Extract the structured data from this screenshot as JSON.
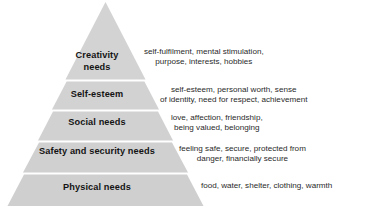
{
  "diagram": {
    "type": "pyramid",
    "tier_count": 5,
    "colors": {
      "tier_fill": "#d3d3d3",
      "tier_fill_alt": "#cfcfcf",
      "separator": "#ffffff",
      "label_text": "#141414",
      "description_text": "#2a2a2a",
      "background": "#ffffff"
    },
    "tiers": [
      {
        "level": 5,
        "label": "Creativity\nneeds",
        "label_line1": "Creativity",
        "label_line2": "needs",
        "description_line1": "self-fulfilment, mental stimulation,",
        "description_line2": "purpose, interests, hobbies"
      },
      {
        "level": 4,
        "label": "Self-esteem",
        "label_line1": "Self-esteem",
        "label_line2": "",
        "description_line1": "self-esteem, personal worth, sense",
        "description_line2": "of identity, need for respect, achievement"
      },
      {
        "level": 3,
        "label": "Social needs",
        "label_line1": "Social needs",
        "label_line2": "",
        "description_line1": "love, affection, friendship,",
        "description_line2": "being valued, belonging"
      },
      {
        "level": 2,
        "label": "Safety and security needs",
        "label_line1": "Safety and security needs",
        "label_line2": "",
        "description_line1": "feeling safe, secure, protected from",
        "description_line2": "danger, financially secure"
      },
      {
        "level": 1,
        "label": "Physical needs",
        "label_line1": "Physical needs",
        "label_line2": "",
        "description_line1": "food, water, shelter, clothing, warmth",
        "description_line2": ""
      }
    ]
  }
}
